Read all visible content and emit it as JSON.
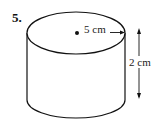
{
  "problem": {
    "number": "5."
  },
  "figure": {
    "shape": "cylinder",
    "radius_label": "5 cm",
    "height_label": "2 cm",
    "colors": {
      "stroke": "#111111",
      "background": "#ffffff"
    }
  }
}
